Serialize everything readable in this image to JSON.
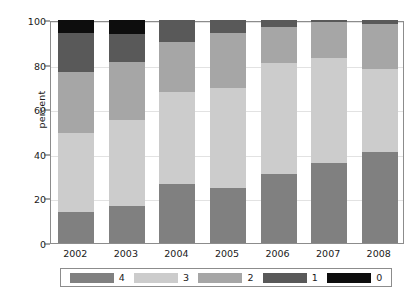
{
  "chart_data": {
    "type": "bar",
    "subtype": "stacked-bar-100",
    "title": "",
    "xlabel": "",
    "ylabel": "percent",
    "ylim": [
      0,
      100
    ],
    "yticks": [
      0,
      20,
      40,
      60,
      80,
      100
    ],
    "ytick_labels": [
      "0",
      "20",
      "40",
      "60",
      "80",
      "100"
    ],
    "grid": true,
    "legend_position": "bottom",
    "stack_order_bottom_to_top": [
      "4",
      "3",
      "2",
      "1",
      "0"
    ],
    "categories": [
      "2002",
      "2003",
      "2004",
      "2005",
      "2006",
      "2007",
      "2008"
    ],
    "series": [
      {
        "name": "4",
        "color": "#808080",
        "values": [
          14.0,
          16.5,
          26.5,
          24.5,
          31.0,
          36.0,
          41.0
        ]
      },
      {
        "name": "3",
        "color": "#cccccc",
        "values": [
          35.5,
          38.5,
          41.0,
          45.0,
          49.5,
          47.0,
          37.0
        ]
      },
      {
        "name": "2",
        "color": "#a6a6a6",
        "values": [
          27.0,
          26.0,
          22.5,
          24.5,
          16.5,
          16.0,
          20.0
        ]
      },
      {
        "name": "1",
        "color": "#595959",
        "values": [
          17.5,
          12.5,
          10.0,
          6.0,
          3.0,
          1.0,
          2.0
        ]
      },
      {
        "name": "0",
        "color": "#0d0d0d",
        "values": [
          6.0,
          6.5,
          0.0,
          0.0,
          0.0,
          0.0,
          0.0
        ]
      }
    ],
    "legend_entries": [
      {
        "label": "4",
        "color": "#808080"
      },
      {
        "label": "3",
        "color": "#cccccc"
      },
      {
        "label": "2",
        "color": "#a6a6a6"
      },
      {
        "label": "1",
        "color": "#595959"
      },
      {
        "label": "0",
        "color": "#0d0d0d"
      }
    ]
  },
  "colors": {
    "frame": "#8c8c8c",
    "grid": "#e2e2e2",
    "text": "#1a1a1a",
    "background": "#ffffff"
  }
}
